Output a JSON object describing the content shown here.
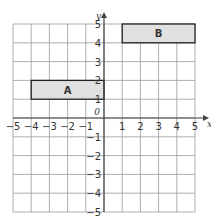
{
  "grid": {
    "x_min": -5,
    "x_max": 5,
    "y_min": -5,
    "y_max": 5,
    "x_axis_label": "x",
    "y_axis_label": "y",
    "origin_label": "0",
    "x_ticks": [
      "-5",
      "-4",
      "-3",
      "-2",
      "-1",
      "1",
      "2",
      "3",
      "4",
      "5"
    ],
    "y_ticks": [
      "5",
      "4",
      "3",
      "2",
      "1",
      "-1",
      "-2",
      "-3",
      "-4",
      "-5"
    ]
  },
  "shapes": [
    {
      "label": "A",
      "x1": -4,
      "y1": 1,
      "x2": 0,
      "y2": 2,
      "fill": "#e0e0e0",
      "stroke": "#222222"
    },
    {
      "label": "B",
      "x1": 1,
      "y1": 4,
      "x2": 5,
      "y2": 5,
      "fill": "#e0e0e0",
      "stroke": "#222222"
    }
  ],
  "colors": {
    "grid": "#9a9a9a",
    "axis": "#444444"
  }
}
